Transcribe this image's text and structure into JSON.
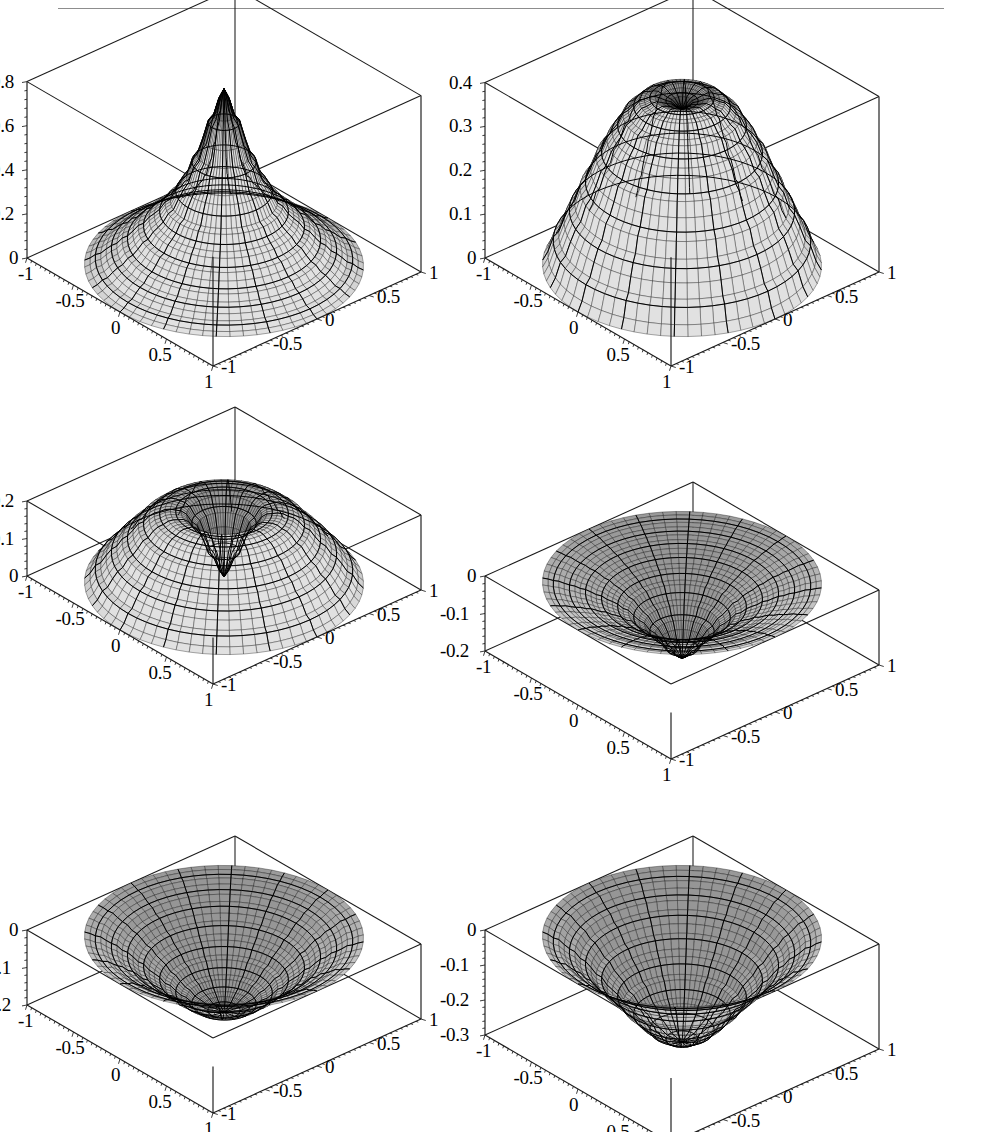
{
  "figure": {
    "kind": "grid-of-3d-surface-plots",
    "rows": 3,
    "cols": 2,
    "header_rule": true,
    "style": "mathematica-plot3d-mesh",
    "mesh_color": "#000000",
    "surface_fill": "#b9b9b9",
    "frame_color": "#1a1a1a",
    "background": "#ffffff"
  },
  "chart_data": [
    {
      "id": "plot-1",
      "type": "surface",
      "title": "",
      "xlabel": "",
      "ylabel": "",
      "zlabel": "",
      "xlim": [
        -1,
        1
      ],
      "ylim": [
        -1,
        1
      ],
      "zlim": [
        0,
        0.9
      ],
      "grid": false,
      "legend": "none",
      "x_ticks": [
        "-1",
        "-0.5",
        "0",
        "0.5",
        "1"
      ],
      "y_ticks": [
        "-1",
        "-0.5",
        "0",
        "0.5",
        "1"
      ],
      "z_ticks": [
        "0",
        "0.2",
        "0.4",
        "0.6",
        "0.8"
      ],
      "radial_profile_note": "axisymmetric peak at r=0, decaying to 0 at r=1",
      "radial_samples_r": [
        0.0,
        0.1,
        0.2,
        0.3,
        0.4,
        0.5,
        0.6,
        0.7,
        0.8,
        0.9,
        1.0
      ],
      "radial_samples_z": [
        0.9,
        0.74,
        0.56,
        0.42,
        0.32,
        0.25,
        0.19,
        0.13,
        0.08,
        0.035,
        0.0
      ]
    },
    {
      "id": "plot-2",
      "type": "surface",
      "title": "",
      "xlabel": "",
      "ylabel": "",
      "zlabel": "",
      "xlim": [
        -1,
        1
      ],
      "ylim": [
        -1,
        1
      ],
      "zlim": [
        0,
        0.45
      ],
      "grid": false,
      "legend": "none",
      "x_ticks": [
        "-1",
        "-0.5",
        "0",
        "0.5",
        "1"
      ],
      "y_ticks": [
        "-1",
        "-0.5",
        "0",
        "0.5",
        "1"
      ],
      "z_ticks": [
        "0",
        "0.1",
        "0.2",
        "0.3",
        "0.4"
      ],
      "radial_profile_note": "dome with small central dimple",
      "radial_samples_r": [
        0.0,
        0.1,
        0.2,
        0.3,
        0.4,
        0.5,
        0.6,
        0.7,
        0.8,
        0.9,
        1.0
      ],
      "radial_samples_z": [
        0.4,
        0.42,
        0.43,
        0.42,
        0.39,
        0.34,
        0.28,
        0.21,
        0.14,
        0.07,
        0.0
      ]
    },
    {
      "id": "plot-3",
      "type": "surface",
      "title": "",
      "xlabel": "",
      "ylabel": "",
      "zlabel": "",
      "xlim": [
        -1,
        1
      ],
      "ylim": [
        -1,
        1
      ],
      "zlim": [
        0,
        0.25
      ],
      "grid": false,
      "legend": "none",
      "x_ticks": [
        "-1",
        "-0.5",
        "0",
        "0.5",
        "1"
      ],
      "y_ticks": [
        "-1",
        "-0.5",
        "0",
        "0.5",
        "1"
      ],
      "z_ticks": [
        "0",
        "0.1",
        "0.2"
      ],
      "radial_profile_note": "torus / annular ridge with deep central hole",
      "radial_samples_r": [
        0.0,
        0.1,
        0.2,
        0.3,
        0.4,
        0.5,
        0.6,
        0.7,
        0.8,
        0.9,
        1.0
      ],
      "radial_samples_z": [
        0.02,
        0.1,
        0.19,
        0.235,
        0.24,
        0.225,
        0.19,
        0.145,
        0.1,
        0.05,
        0.0
      ]
    },
    {
      "id": "plot-4",
      "type": "surface",
      "title": "",
      "xlabel": "",
      "ylabel": "",
      "zlabel": "",
      "xlim": [
        -1,
        1
      ],
      "ylim": [
        -1,
        1
      ],
      "zlim": [
        -0.25,
        0
      ],
      "grid": false,
      "legend": "none",
      "x_ticks": [
        "-1",
        "-0.5",
        "0",
        "0.5",
        "1"
      ],
      "y_ticks": [
        "-1",
        "-0.5",
        "0",
        "0.5",
        "1"
      ],
      "z_ticks": [
        "0",
        "-0.1",
        "-0.2"
      ],
      "radial_profile_note": "funnel: rim near 0, sharp dip to -0.25 at centre",
      "radial_samples_r": [
        0.0,
        0.1,
        0.2,
        0.3,
        0.4,
        0.5,
        0.6,
        0.7,
        0.8,
        0.9,
        1.0
      ],
      "radial_samples_z": [
        -0.25,
        -0.22,
        -0.17,
        -0.13,
        -0.095,
        -0.07,
        -0.05,
        -0.033,
        -0.02,
        -0.008,
        0.0
      ]
    },
    {
      "id": "plot-5",
      "type": "surface",
      "title": "",
      "xlabel": "",
      "ylabel": "",
      "zlabel": "",
      "xlim": [
        -1,
        1
      ],
      "ylim": [
        -1,
        1
      ],
      "zlim": [
        -0.25,
        0
      ],
      "grid": false,
      "legend": "none",
      "x_ticks": [
        "-1",
        "-0.5",
        "0",
        "0.5",
        "1"
      ],
      "y_ticks": [
        "-1",
        "-0.5",
        "0",
        "0.5",
        "1"
      ],
      "z_ticks": [
        "0",
        "-0.1",
        "-0.2"
      ],
      "radial_profile_note": "smooth bowl, minimum -0.25 at centre",
      "radial_samples_r": [
        0.0,
        0.1,
        0.2,
        0.3,
        0.4,
        0.5,
        0.6,
        0.7,
        0.8,
        0.9,
        1.0
      ],
      "radial_samples_z": [
        -0.25,
        -0.245,
        -0.228,
        -0.2,
        -0.166,
        -0.13,
        -0.095,
        -0.062,
        -0.035,
        -0.013,
        0.0
      ]
    },
    {
      "id": "plot-6",
      "type": "surface",
      "title": "",
      "xlabel": "",
      "ylabel": "",
      "zlabel": "",
      "xlim": [
        -1,
        1
      ],
      "ylim": [
        -1,
        1
      ],
      "zlim": [
        -0.35,
        0
      ],
      "grid": false,
      "legend": "none",
      "x_ticks": [
        "-1",
        "-0.5",
        "0",
        "0.5",
        "1"
      ],
      "y_ticks": [
        "-1",
        "-0.5",
        "0",
        "0.5",
        "1"
      ],
      "z_ticks": [
        "0",
        "-0.1",
        "-0.2",
        "-0.3"
      ],
      "radial_profile_note": "deeper bowl, minimum -0.35 at centre",
      "radial_samples_r": [
        0.0,
        0.1,
        0.2,
        0.3,
        0.4,
        0.5,
        0.6,
        0.7,
        0.8,
        0.9,
        1.0
      ],
      "radial_samples_z": [
        -0.35,
        -0.342,
        -0.318,
        -0.278,
        -0.232,
        -0.184,
        -0.137,
        -0.092,
        -0.053,
        -0.021,
        0.0
      ]
    }
  ],
  "plots": [
    {
      "name": "plot-1",
      "z_tick_labels": [
        "0.8",
        "0.6",
        "0.4",
        "0.2",
        "0"
      ],
      "x_tick_labels": [
        "-1",
        "-0.5",
        "0",
        "0.5",
        "1"
      ],
      "y_tick_labels": [
        "1",
        "0.5",
        "0",
        "-0.5",
        "-1"
      ]
    },
    {
      "name": "plot-2",
      "z_tick_labels": [
        "0.4",
        "0.3",
        "0.2",
        "0.1",
        "0"
      ],
      "x_tick_labels": [
        "-1",
        "-0.5",
        "0",
        "0.5",
        "1"
      ],
      "y_tick_labels": [
        "1",
        "0.5",
        "0",
        "-0.5",
        "-1"
      ]
    },
    {
      "name": "plot-3",
      "z_tick_labels": [
        "0.2",
        "0.1",
        "0"
      ],
      "x_tick_labels": [
        "-1",
        "-0.5",
        "0",
        "0.5",
        "1"
      ],
      "y_tick_labels": [
        "1",
        "0.5",
        "0",
        "-0.5",
        "-1"
      ]
    },
    {
      "name": "plot-4",
      "z_tick_labels": [
        "0",
        "-0.1",
        "-0.2"
      ],
      "x_tick_labels": [
        "-1",
        "-0.5",
        "0",
        "0.5",
        "1"
      ],
      "y_tick_labels": [
        "1",
        "0.5",
        "0",
        "-0.5",
        "-1"
      ]
    },
    {
      "name": "plot-5",
      "z_tick_labels": [
        "0",
        "-0.1",
        "-0.2"
      ],
      "x_tick_labels": [
        "-1",
        "-0.5",
        "0",
        "0.5",
        "1"
      ],
      "y_tick_labels": [
        "1",
        "0.5",
        "0",
        "-0.5",
        "-1"
      ]
    },
    {
      "name": "plot-6",
      "z_tick_labels": [
        "0",
        "-0.1",
        "-0.2",
        "-0.3"
      ],
      "x_tick_labels": [
        "-1",
        "-0.5",
        "0",
        "0.5",
        "1"
      ],
      "y_tick_labels": [
        "1",
        "0.5",
        "0",
        "-0.5",
        "-1"
      ]
    }
  ]
}
